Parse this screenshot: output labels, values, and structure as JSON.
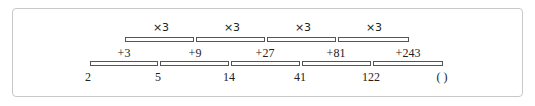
{
  "sequence": {
    "terms": [
      "2",
      "5",
      "14",
      "41",
      "122",
      "( )"
    ],
    "differences": [
      "+3",
      "+9",
      "+27",
      "+81",
      "+243"
    ],
    "ratios": [
      "×3",
      "×3",
      "×3",
      "×3"
    ]
  },
  "colors": {
    "border": "#c8c8c8",
    "bar": "#555555",
    "text": "#222222"
  }
}
